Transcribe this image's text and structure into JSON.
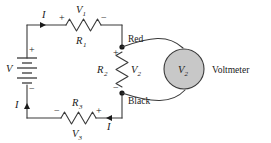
{
  "figure": {
    "background_color": "#ffffff",
    "line_color": "#3a3a3a",
    "meter_fill_color": "#c8c8c8"
  },
  "source": {
    "label_V": "V",
    "polarity_plus": "+",
    "polarity_minus": "−",
    "type": "battery"
  },
  "top_branch": {
    "current_label": "I",
    "voltage_label": "V",
    "voltage_sub": "1",
    "resistor_label": "R",
    "resistor_sub": "1",
    "plus": "+",
    "minus": "−"
  },
  "middle_branch": {
    "voltage_label": "V",
    "voltage_sub": "2",
    "resistor_label": "R",
    "resistor_sub": "2",
    "plus": "+",
    "minus": "−"
  },
  "bottom_branch": {
    "current_label_left": "I",
    "current_label_right": "I",
    "voltage_label": "V",
    "voltage_sub": "3",
    "resistor_label": "R",
    "resistor_sub": "3",
    "plus": "+",
    "minus": "−"
  },
  "terminals": {
    "red_label": "Red",
    "black_label": "Black"
  },
  "voltmeter": {
    "symbol_label": "V",
    "symbol_sub": "2",
    "name": "Voltmeter"
  }
}
